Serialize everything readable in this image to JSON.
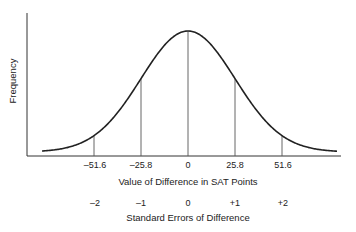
{
  "chart_data": {
    "type": "line",
    "title": "",
    "xlabel": "Value of Difference in SAT Points",
    "ylabel": "Frequency",
    "secondary_xlabel": "Standard Errors of Difference",
    "distribution": "normal",
    "mean": 0,
    "standard_error": 25.8,
    "x_ticks": [
      "-51.6",
      "-25.8",
      "0",
      "25.8",
      "51.6"
    ],
    "x_tick_values": [
      -51.6,
      -25.8,
      0,
      25.8,
      51.6
    ],
    "secondary_ticks": [
      "-2",
      "-1",
      "0",
      "+1",
      "+2"
    ],
    "secondary_tick_values": [
      -2,
      -1,
      0,
      1,
      2
    ],
    "vertical_lines_at": [
      -51.6,
      -25.8,
      0,
      25.8,
      51.6
    ],
    "grid": false,
    "legend": null
  },
  "labels": {
    "ylabel": "Frequency",
    "xlabel": "Value of Difference in SAT Points",
    "secondary_xlabel": "Standard Errors of Difference",
    "ticks": [
      "–51.6",
      "–25.8",
      "0",
      "25.8",
      "51.6"
    ],
    "se_ticks": [
      "–2",
      "–1",
      "0",
      "+1",
      "+2"
    ]
  }
}
